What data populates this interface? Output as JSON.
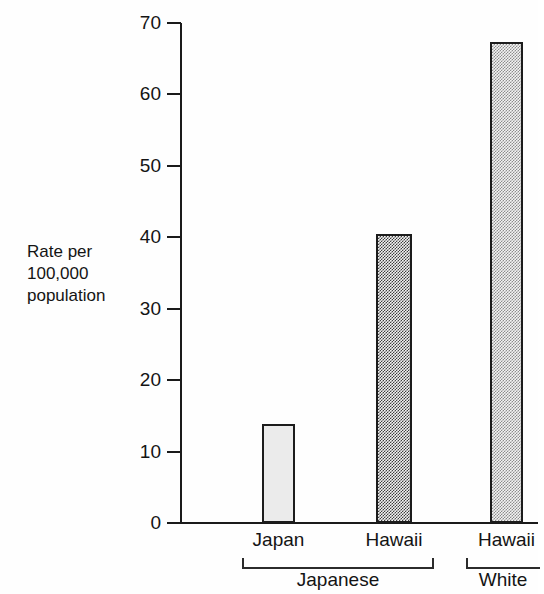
{
  "axis_label": {
    "line1": "Rate per",
    "line2": "100,000",
    "line3": "population"
  },
  "bleed_through": {
    "top_left": "",
    "center": "",
    "top_right": ""
  },
  "chart_data": {
    "type": "bar",
    "title": "",
    "subtitle": "",
    "xlabel": "",
    "ylabel": "Rate per 100,000 population",
    "ylim": [
      0,
      70
    ],
    "ytick_labels": [
      "70",
      "60",
      "50",
      "40",
      "30",
      "20",
      "10",
      "0"
    ],
    "ytick_values": [
      70,
      60,
      50,
      40,
      30,
      20,
      10,
      0
    ],
    "ytick_interval": 10,
    "grid": false,
    "legend": false,
    "legend_position": "none",
    "categories": [
      "Japan",
      "Hawaii",
      "Hawaii"
    ],
    "values": [
      13.8,
      40.4,
      67.3
    ],
    "bar_fills": [
      "light-solid",
      "dark-checker-dither",
      "medium-sparse-dither"
    ],
    "bar_colors": [
      "#ebebeb",
      "#808080",
      "#c8c8c8"
    ],
    "groups": [
      {
        "label": "Japanese",
        "categories": [
          "Japan",
          "Hawaii"
        ],
        "member_indices": [
          0,
          1
        ]
      },
      {
        "label": "White",
        "categories": [
          "Hawaii"
        ],
        "member_indices": [
          2
        ]
      }
    ],
    "series": [
      {
        "name": "Rate per 100,000 population",
        "points": [
          {
            "category": "Japan",
            "group": "Japanese",
            "value": 13.8
          },
          {
            "category": "Hawaii",
            "group": "Japanese",
            "value": 40.4
          },
          {
            "category": "Hawaii",
            "group": "White",
            "value": 67.3
          }
        ]
      }
    ]
  }
}
